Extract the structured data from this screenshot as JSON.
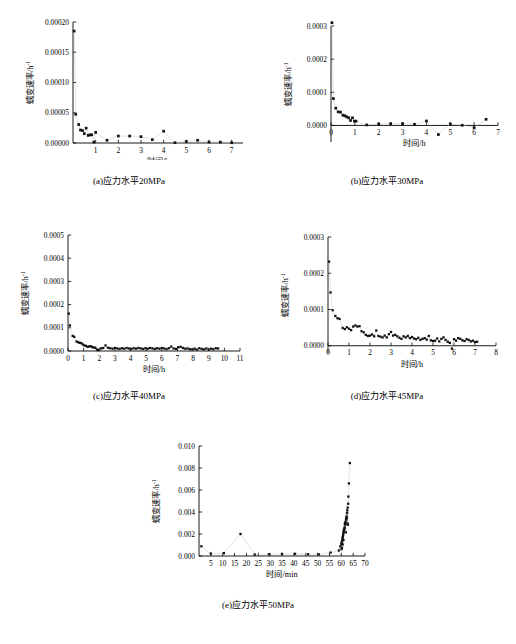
{
  "figure": {
    "axis_titles": {
      "y": "蠕变速率/h",
      "y_superscript": "-1",
      "x_hours": "时间/h",
      "x_minutes": "时间/min"
    }
  },
  "chart_data": [
    {
      "id": "a",
      "type": "scatter",
      "title": "",
      "caption": "(a)应力水平20MPa",
      "xlabel": "时间/h",
      "ylabel": "蠕变速率/h⁻¹",
      "xlim": [
        0,
        7.5
      ],
      "ylim": [
        0,
        0.0002
      ],
      "xticks": [
        1,
        2,
        3,
        4,
        5,
        6,
        7
      ],
      "yticks": [
        0.0,
        5e-05,
        0.0001,
        0.00015,
        0.0002
      ],
      "ytick_labels": [
        "0.00000",
        "0.00005",
        "0.00010",
        "0.00015",
        "0.00020"
      ],
      "xtick_labels": [
        "1",
        "2",
        "3",
        "4",
        "5",
        "6",
        "7"
      ],
      "grid": false,
      "legend": "none",
      "points": [
        [
          0.05,
          0.000185
        ],
        [
          0.12,
          4.75e-05
        ],
        [
          0.25,
          3.05e-05
        ],
        [
          0.33,
          2.15e-05
        ],
        [
          0.42,
          2.05e-05
        ],
        [
          0.5,
          1.55e-05
        ],
        [
          0.58,
          2.45e-05
        ],
        [
          0.67,
          1.25e-05
        ],
        [
          0.75,
          1.35e-05
        ],
        [
          0.83,
          1.35e-05
        ],
        [
          0.92,
          1.5e-06
        ],
        [
          1.0,
          1.75e-05
        ],
        [
          1.5,
          4.5e-06
        ],
        [
          2.0,
          1.15e-05
        ],
        [
          2.5,
          1.15e-05
        ],
        [
          3.0,
          1.05e-05
        ],
        [
          3.5,
          5.5e-06
        ],
        [
          4.0,
          1.95e-05
        ],
        [
          4.5,
          5e-07
        ],
        [
          5.0,
          2.5e-06
        ],
        [
          5.5,
          4.5e-06
        ],
        [
          6.0,
          1.5e-06
        ],
        [
          6.5,
          1.5e-06
        ],
        [
          7.0,
          5e-07
        ]
      ]
    },
    {
      "id": "b",
      "type": "scatter",
      "title": "",
      "caption": "(b)应力水平30MPa",
      "xlabel": "时间/h",
      "ylabel": "蠕变速率/h⁻¹",
      "xlim": [
        0,
        7
      ],
      "ylim": [
        -5e-05,
        0.0003
      ],
      "xticks": [
        0,
        1,
        2,
        3,
        4,
        5,
        6,
        7
      ],
      "yticks": [
        0.0,
        0.0001,
        0.0002,
        0.0003
      ],
      "ytick_labels": [
        "0.0000",
        "0.0001",
        "0.0002",
        "0.0003"
      ],
      "xtick_labels": [
        "0",
        "1",
        "2",
        "3",
        "4",
        "5",
        "6",
        "7"
      ],
      "grid": false,
      "legend": "none",
      "points": [
        [
          0.04,
          0.00031
        ],
        [
          0.1,
          8.1e-05
        ],
        [
          0.2,
          5.2e-05
        ],
        [
          0.3,
          4.1e-05
        ],
        [
          0.4,
          4e-05
        ],
        [
          0.5,
          3.1e-05
        ],
        [
          0.58,
          2.9e-05
        ],
        [
          0.66,
          2.6e-05
        ],
        [
          0.74,
          2.3e-05
        ],
        [
          0.82,
          1.5e-05
        ],
        [
          0.9,
          2.3e-05
        ],
        [
          0.98,
          1.3e-05
        ],
        [
          1.05,
          1.3e-05
        ],
        [
          1.5,
          1.5e-06
        ],
        [
          2.0,
          4.5e-06
        ],
        [
          2.5,
          5.5e-06
        ],
        [
          3.0,
          5.5e-06
        ],
        [
          3.5,
          3.5e-06
        ],
        [
          4.0,
          1.35e-05
        ],
        [
          4.5,
          -2.75e-05
        ],
        [
          5.0,
          4.5e-06
        ],
        [
          5.5,
          5e-07
        ],
        [
          6.0,
          -6.5e-06
        ],
        [
          6.5,
          1.85e-05
        ]
      ]
    },
    {
      "id": "c",
      "type": "scatter",
      "title": "",
      "caption": "(c)应力水平40MPa",
      "xlabel": "时间/h",
      "ylabel": "蠕变速率/h⁻¹",
      "xlim": [
        0,
        11
      ],
      "ylim": [
        0,
        0.0005
      ],
      "xticks": [
        0,
        1,
        2,
        3,
        4,
        5,
        6,
        7,
        8,
        9,
        10,
        11
      ],
      "yticks": [
        0.0,
        0.0001,
        0.0002,
        0.0003,
        0.0004,
        0.0005
      ],
      "ytick_labels": [
        "0.0000",
        "0.0001",
        "0.0002",
        "0.0003",
        "0.0004",
        "0.0005"
      ],
      "xtick_labels": [
        "0",
        "1",
        "2",
        "3",
        "4",
        "5",
        "6",
        "7",
        "8",
        "9",
        "10",
        "11"
      ],
      "grid": false,
      "legend": "none",
      "points": [
        [
          0.05,
          0.000161
        ],
        [
          0.12,
          0.00011
        ],
        [
          0.3,
          6.5e-05
        ],
        [
          0.4,
          6.1e-05
        ],
        [
          0.55,
          4.1e-05
        ],
        [
          0.65,
          3.8e-05
        ],
        [
          0.75,
          3.5e-05
        ],
        [
          0.85,
          3.4e-05
        ],
        [
          0.95,
          2.8e-05
        ],
        [
          1.05,
          2.4e-05
        ],
        [
          1.15,
          2.2e-05
        ],
        [
          1.25,
          1.8e-05
        ],
        [
          1.35,
          1.9e-05
        ],
        [
          1.45,
          2.1e-05
        ],
        [
          1.55,
          1.7e-05
        ],
        [
          1.65,
          1.5e-05
        ],
        [
          1.75,
          1.4e-05
        ],
        [
          1.85,
          6e-06
        ],
        [
          1.95,
          4e-06
        ],
        [
          2.1,
          1.1e-05
        ],
        [
          2.25,
          1.3e-05
        ],
        [
          2.4,
          2.4e-05
        ],
        [
          2.55,
          1.4e-05
        ],
        [
          2.7,
          1.2e-05
        ],
        [
          2.85,
          1e-05
        ],
        [
          3.0,
          1.3e-05
        ],
        [
          3.15,
          1.1e-05
        ],
        [
          3.3,
          9e-06
        ],
        [
          3.45,
          1.2e-05
        ],
        [
          3.6,
          1e-05
        ],
        [
          3.75,
          1.3e-05
        ],
        [
          3.9,
          1.1e-05
        ],
        [
          4.05,
          9e-06
        ],
        [
          4.2,
          1.2e-05
        ],
        [
          4.35,
          1e-05
        ],
        [
          4.5,
          1.3e-05
        ],
        [
          4.65,
          1.1e-05
        ],
        [
          4.8,
          9e-06
        ],
        [
          4.95,
          1.2e-05
        ],
        [
          5.1,
          1e-05
        ],
        [
          5.25,
          1.3e-05
        ],
        [
          5.4,
          1.1e-05
        ],
        [
          5.55,
          9e-06
        ],
        [
          5.7,
          1.2e-05
        ],
        [
          5.85,
          1e-05
        ],
        [
          6.0,
          1.3e-05
        ],
        [
          6.15,
          1.1e-05
        ],
        [
          6.3,
          8e-06
        ],
        [
          6.45,
          1.2e-05
        ],
        [
          6.6,
          1.9e-05
        ],
        [
          6.75,
          1.1e-05
        ],
        [
          6.9,
          9e-06
        ],
        [
          7.05,
          1.6e-05
        ],
        [
          7.2,
          1.8e-05
        ],
        [
          7.35,
          1.3e-05
        ],
        [
          7.5,
          1e-05
        ],
        [
          7.65,
          1.1e-05
        ],
        [
          7.8,
          8e-06
        ],
        [
          7.95,
          7e-06
        ],
        [
          8.1,
          1e-05
        ],
        [
          8.25,
          6e-06
        ],
        [
          8.4,
          1.2e-05
        ],
        [
          8.55,
          9e-06
        ],
        [
          8.7,
          7e-06
        ],
        [
          8.85,
          1.1e-05
        ],
        [
          9.0,
          6e-06
        ],
        [
          9.15,
          1e-05
        ],
        [
          9.3,
          8e-06
        ],
        [
          9.45,
          1.2e-05
        ],
        [
          9.6,
          1.1e-05
        ]
      ]
    },
    {
      "id": "d",
      "type": "scatter",
      "title": "",
      "caption": "(d)应力水平45MPa",
      "xlabel": "时间/h",
      "ylabel": "蠕变速率/h⁻¹",
      "xlim": [
        0,
        8
      ],
      "ylim": [
        -2e-05,
        0.0003
      ],
      "xticks": [
        0,
        1,
        2,
        3,
        4,
        5,
        6,
        7,
        8
      ],
      "yticks": [
        0.0,
        0.0001,
        0.0002,
        0.0003
      ],
      "ytick_labels": [
        "0.0000",
        "0.0001",
        "0.0002",
        "0.0003"
      ],
      "xtick_labels": [
        "0",
        "1",
        "2",
        "3",
        "4",
        "5",
        "6",
        "7",
        "8"
      ],
      "grid": false,
      "legend": "none",
      "points": [
        [
          0.05,
          0.000232
        ],
        [
          0.12,
          0.000147
        ],
        [
          0.22,
          9.8e-05
        ],
        [
          0.35,
          8.2e-05
        ],
        [
          0.45,
          7.6e-05
        ],
        [
          0.55,
          7.4e-05
        ],
        [
          0.7,
          4.9e-05
        ],
        [
          0.8,
          4.6e-05
        ],
        [
          0.9,
          5.1e-05
        ],
        [
          1.0,
          4.7e-05
        ],
        [
          1.1,
          4.3e-05
        ],
        [
          1.2,
          5.3e-05
        ],
        [
          1.3,
          5.6e-05
        ],
        [
          1.4,
          5.3e-05
        ],
        [
          1.5,
          5.4e-05
        ],
        [
          1.6,
          4e-05
        ],
        [
          1.7,
          3.7e-05
        ],
        [
          1.8,
          3e-05
        ],
        [
          1.9,
          2.7e-05
        ],
        [
          2.0,
          2.8e-05
        ],
        [
          2.1,
          3.1e-05
        ],
        [
          2.2,
          2.6e-05
        ],
        [
          2.3,
          4.2e-05
        ],
        [
          2.4,
          2.7e-05
        ],
        [
          2.5,
          2.5e-05
        ],
        [
          2.6,
          2.3e-05
        ],
        [
          2.7,
          2.8e-05
        ],
        [
          2.8,
          2.3e-05
        ],
        [
          2.9,
          3.2e-05
        ],
        [
          3.0,
          3.8e-05
        ],
        [
          3.1,
          2.8e-05
        ],
        [
          3.2,
          3e-05
        ],
        [
          3.3,
          2.6e-05
        ],
        [
          3.4,
          2.2e-05
        ],
        [
          3.5,
          1.9e-05
        ],
        [
          3.6,
          2.6e-05
        ],
        [
          3.7,
          2.3e-05
        ],
        [
          3.8,
          2.7e-05
        ],
        [
          3.9,
          2.1e-05
        ],
        [
          4.0,
          2.4e-05
        ],
        [
          4.1,
          2e-05
        ],
        [
          4.2,
          1.8e-05
        ],
        [
          4.3,
          2.2e-05
        ],
        [
          4.4,
          1.6e-05
        ],
        [
          4.5,
          1.9e-05
        ],
        [
          4.6,
          2.1e-05
        ],
        [
          4.7,
          1.7e-05
        ],
        [
          4.8,
          2.7e-05
        ],
        [
          4.9,
          1.5e-05
        ],
        [
          5.0,
          1.3e-05
        ],
        [
          5.1,
          1.4e-05
        ],
        [
          5.2,
          2e-05
        ],
        [
          5.3,
          1.2e-05
        ],
        [
          5.4,
          1.9e-05
        ],
        [
          5.5,
          2.3e-05
        ],
        [
          5.6,
          1.6e-05
        ],
        [
          5.7,
          1.1e-05
        ],
        [
          5.8,
          8e-06
        ],
        [
          5.9,
          -8e-06
        ],
        [
          6.0,
          1.8e-05
        ],
        [
          6.1,
          1.4e-05
        ],
        [
          6.2,
          2.1e-05
        ],
        [
          6.3,
          1.9e-05
        ],
        [
          6.4,
          1.5e-05
        ],
        [
          6.5,
          1.3e-05
        ],
        [
          6.6,
          1.8e-05
        ],
        [
          6.7,
          1.6e-05
        ],
        [
          6.8,
          1.2e-05
        ],
        [
          6.9,
          1.4e-05
        ],
        [
          7.0,
          1e-05
        ],
        [
          7.1,
          1.1e-05
        ]
      ]
    },
    {
      "id": "e",
      "type": "scatter",
      "title": "",
      "caption": "(e)应力水平50MPa",
      "xlabel": "时间/min",
      "ylabel": "蠕变速率/h⁻¹",
      "xlim": [
        0,
        70
      ],
      "ylim": [
        0,
        0.01
      ],
      "xticks": [
        5,
        10,
        15,
        20,
        25,
        30,
        35,
        40,
        45,
        50,
        55,
        60,
        65,
        70
      ],
      "yticks": [
        0.0,
        0.002,
        0.004,
        0.006,
        0.008,
        0.01
      ],
      "ytick_labels": [
        "0.000",
        "0.002",
        "0.004",
        "0.006",
        "0.008",
        "0.010"
      ],
      "xtick_labels": [
        "5",
        "10",
        "15",
        "20",
        "25",
        "30",
        "35",
        "40",
        "45",
        "50",
        "55",
        "60",
        "65",
        "70"
      ],
      "grid": false,
      "legend": "none",
      "points": [
        [
          1.0,
          0.00088
        ],
        [
          5.0,
          0.00022
        ],
        [
          10.5,
          0.00026
        ],
        [
          17.5,
          0.002
        ],
        [
          23.5,
          0.00013
        ],
        [
          29.5,
          0.00016
        ],
        [
          35.0,
          0.00019
        ],
        [
          40.5,
          0.0002
        ],
        [
          46.0,
          0.00016
        ],
        [
          50.5,
          0.00015
        ],
        [
          55.5,
          0.00031
        ],
        [
          59.0,
          0.0005
        ],
        [
          59.6,
          0.00088
        ],
        [
          60.0,
          0.0011
        ],
        [
          60.2,
          0.00125
        ],
        [
          60.4,
          0.0014
        ],
        [
          60.5,
          0.00155
        ],
        [
          60.6,
          0.0017
        ],
        [
          60.7,
          0.0018
        ],
        [
          60.8,
          0.00195
        ],
        [
          60.9,
          0.0021
        ],
        [
          61.0,
          0.00225
        ],
        [
          61.1,
          0.00235
        ],
        [
          61.2,
          0.0024
        ],
        [
          61.4,
          0.0026
        ],
        [
          61.5,
          0.0029
        ],
        [
          61.6,
          0.003
        ],
        [
          61.8,
          0.0031
        ],
        [
          62.0,
          0.0033
        ],
        [
          62.1,
          0.00345
        ],
        [
          62.2,
          0.0036
        ],
        [
          62.4,
          0.0039
        ],
        [
          62.5,
          0.00415
        ],
        [
          62.7,
          0.0044
        ],
        [
          62.9,
          0.00475
        ],
        [
          63.0,
          0.0054
        ],
        [
          63.2,
          0.0066
        ],
        [
          63.6,
          0.00845
        ],
        [
          60.3,
          0.00075
        ],
        [
          60.1,
          0.00062
        ],
        [
          61.3,
          0.0025
        ],
        [
          61.7,
          0.00285
        ],
        [
          62.3,
          0.00345
        ],
        [
          62.6,
          0.00295
        ],
        [
          62.8,
          0.00285
        ],
        [
          61.9,
          0.00215
        ],
        [
          60.6,
          0.00105
        ],
        [
          60.9,
          0.00145
        ]
      ]
    }
  ]
}
